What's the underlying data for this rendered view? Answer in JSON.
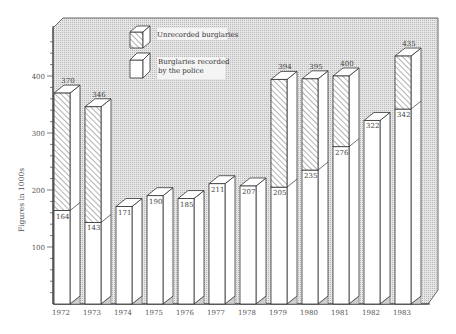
{
  "chart_data": {
    "type": "bar",
    "subtype": "stacked-3d",
    "title": "",
    "xlabel": "",
    "ylabel": "Figures in 1000s",
    "ylim": [
      0,
      450
    ],
    "yticks": [
      100,
      200,
      300,
      400
    ],
    "grid": false,
    "legend_position": "top-center",
    "categories": [
      "1972",
      "1973",
      "1974",
      "1975",
      "1976",
      "1977",
      "1978",
      "1979",
      "1980",
      "1981",
      "1982",
      "1983"
    ],
    "series": [
      {
        "name": "Burglaries recorded by the police",
        "pattern": "plain",
        "values": [
          164,
          143,
          171,
          190,
          185,
          211,
          207,
          205,
          235,
          276,
          322,
          342
        ]
      },
      {
        "name": "Unrecorded burglaries",
        "pattern": "hatched",
        "values": [
          206,
          203,
          null,
          null,
          null,
          null,
          null,
          189,
          160,
          124,
          null,
          93
        ]
      }
    ],
    "totals": [
      370,
      346,
      null,
      null,
      null,
      null,
      null,
      394,
      395,
      400,
      null,
      435
    ],
    "data_labels": {
      "recorded": [
        "164",
        "143",
        "171",
        "190",
        "185",
        "211",
        "207",
        "205",
        "235",
        "276",
        "322",
        "342"
      ],
      "total": [
        "370",
        "346",
        "",
        "",
        "",
        "",
        "",
        "394",
        "395",
        "400",
        "",
        "435"
      ]
    }
  },
  "legend": {
    "unrecorded": "Unrecorded burglaries",
    "recorded_line1": "Burglaries recorded",
    "recorded_line2": "by the police"
  },
  "axis": {
    "ylabel": "Figures in 1000s",
    "yticks": [
      "100",
      "200",
      "300",
      "400"
    ]
  },
  "colors": {
    "panel": "#d9d9d9",
    "bar_face": "#ffffff",
    "outline": "#333333",
    "hatch": "#555555"
  }
}
